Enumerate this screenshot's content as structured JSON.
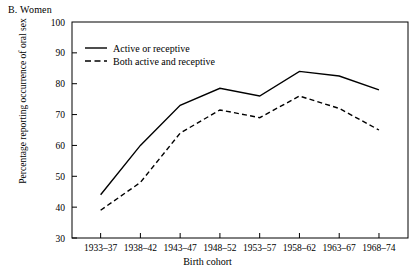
{
  "panel": {
    "label": "B. Women"
  },
  "chart_data": {
    "type": "line",
    "title": "B. Women",
    "xlabel": "Birth cohort",
    "ylabel": "Percentage reporting occurrence of oral sex",
    "categories": [
      "1933–37",
      "1938–42",
      "1943–47",
      "1948–52",
      "1953–57",
      "1958–62",
      "1963–67",
      "1968–74"
    ],
    "ylim": [
      30,
      100
    ],
    "yticks": [
      30,
      40,
      50,
      60,
      70,
      80,
      90,
      100
    ],
    "grid": false,
    "legend_position": "top-left-inside",
    "series": [
      {
        "name": "Active or receptive",
        "style": "solid",
        "color": "#000000",
        "values": [
          44,
          60,
          73,
          78.5,
          76,
          84,
          82.5,
          78
        ]
      },
      {
        "name": "Both active and receptive",
        "style": "dashed",
        "color": "#000000",
        "values": [
          39,
          48,
          64,
          71.5,
          69,
          76,
          72,
          65
        ]
      }
    ]
  }
}
